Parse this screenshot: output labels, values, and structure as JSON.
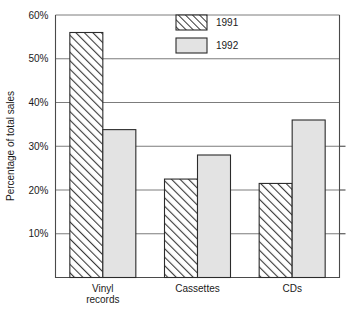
{
  "chart_data": {
    "type": "bar",
    "title": "",
    "subtitle": "",
    "xlabel": "",
    "ylabel": "Percentage of total sales",
    "categories": [
      "Vinyl records",
      "Cassettes",
      "CDs"
    ],
    "category_lines": [
      [
        "Vinyl",
        "records"
      ],
      [
        "Cassettes"
      ],
      [
        "CDs"
      ]
    ],
    "series": [
      {
        "name": "1991",
        "values": [
          56,
          22.5,
          21.5
        ],
        "fill": "diagonal-hatch",
        "color": "#ffffff"
      },
      {
        "name": "1992",
        "values": [
          33.8,
          28,
          36
        ],
        "fill": "solid-light-gray",
        "color": "#e0e0e0"
      }
    ],
    "ylim": [
      0,
      60
    ],
    "yticks": [
      10,
      20,
      30,
      40,
      50,
      60
    ],
    "ytick_labels": [
      "10%",
      "20%",
      "30%",
      "40%",
      "50%",
      "60%"
    ],
    "grid": true,
    "grid_axis": "y",
    "legend": [
      "1991",
      "1992"
    ],
    "legend_position": "top-center"
  }
}
